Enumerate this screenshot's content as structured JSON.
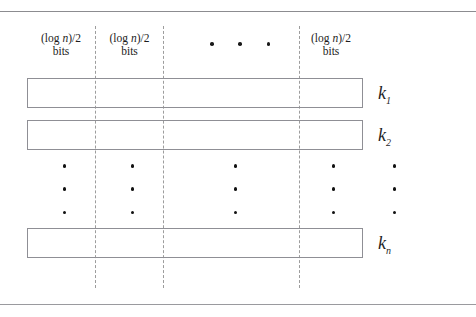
{
  "figure": {
    "type": "bit-partition-diagram",
    "rules": {
      "top": "horizontal-rule",
      "bottom": "horizontal-rule"
    },
    "headers": [
      {
        "line1_prefix": "(log ",
        "line1_var": "n",
        "line1_suffix": ")/2",
        "line2": "bits"
      },
      {
        "line1_prefix": "(log ",
        "line1_var": "n",
        "line1_suffix": ")/2",
        "line2": "bits"
      },
      {
        "line1_prefix": "(log ",
        "line1_var": "n",
        "line1_suffix": ")/2",
        "line2": "bits"
      }
    ],
    "header_ellipsis": {
      "dots": 3,
      "orientation": "horizontal"
    },
    "rows": [
      {
        "label_base": "k",
        "label_sub": "1"
      },
      {
        "label_base": "k",
        "label_sub": "2"
      },
      {
        "label_base": "k",
        "label_sub": "n"
      }
    ],
    "vertical_ellipses": [
      {
        "dots": 3
      },
      {
        "dots": 3
      },
      {
        "dots": 3
      },
      {
        "dots": 3
      },
      {
        "dots": 3
      }
    ],
    "partitions": {
      "dashed_lines": 3
    },
    "colors": {
      "rule": "#8c8c90",
      "box_border": "#8f8f95",
      "dashed_line": "#9d9d9d",
      "text": "#1c1c1c",
      "dot": "#111111",
      "background": "#ffffff"
    }
  }
}
